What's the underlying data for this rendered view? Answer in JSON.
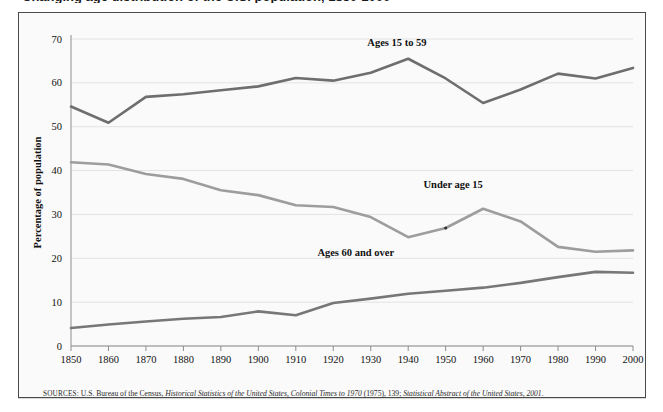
{
  "figure": {
    "title_partial": "Changing age distribution of the U.S. population, 1850-2000",
    "source_prefix": "SOURCES:",
    "source_parts": {
      "p1": " U.S. Bureau of the Census, ",
      "i1": "Historical Statistics of the United States, Colonial Times to 1970",
      "p2": " (1975), 139; ",
      "i2": "Statistical Abstract of the United States, 2001",
      "p3": "."
    }
  },
  "colors": {
    "ages_15_to_59": "#6e6e6e",
    "under_age_15": "#9d9d9d",
    "ages_60_and_over": "#777777",
    "gridline": "#e2e2e2",
    "axis": "#8d8d8d",
    "frame": "#4a4a4a",
    "plot_background": "#fafafa"
  },
  "chart_data": {
    "type": "line",
    "title": "Changing age distribution of the U.S. population, 1850-2000",
    "xlabel": "",
    "ylabel": "Percentage of population",
    "xlim": [
      1850,
      2000
    ],
    "ylim": [
      0,
      70
    ],
    "grid": true,
    "legend": "inline-labels",
    "x": [
      1850,
      1860,
      1870,
      1880,
      1890,
      1900,
      1910,
      1920,
      1930,
      1940,
      1950,
      1960,
      1970,
      1980,
      1990,
      2000
    ],
    "xtick_labels": [
      "1850",
      "1860",
      "1870",
      "1880",
      "1890",
      "1900",
      "1910",
      "1920",
      "1930",
      "1940",
      "1950",
      "1960",
      "1970",
      "1980",
      "1990",
      "2000"
    ],
    "ytick_labels": [
      "0",
      "10",
      "20",
      "30",
      "40",
      "50",
      "60",
      "70"
    ],
    "yticks": [
      0,
      10,
      20,
      30,
      40,
      50,
      60,
      70
    ],
    "series": [
      {
        "name": "Ages 15 to 59",
        "label": "Ages 15 to 59",
        "color": "#6e6e6e",
        "values": [
          54.6,
          50.9,
          56.8,
          57.4,
          58.3,
          59.2,
          61.1,
          60.5,
          62.3,
          65.5,
          61.0,
          55.4,
          58.5,
          62.1,
          61.0,
          63.4
        ]
      },
      {
        "name": "Under age 15",
        "label": "Under age 15",
        "color": "#9d9d9d",
        "values": [
          41.9,
          41.4,
          39.2,
          38.1,
          35.5,
          34.4,
          32.1,
          31.7,
          29.4,
          24.8,
          26.9,
          31.3,
          28.4,
          22.6,
          21.5,
          21.8
        ]
      },
      {
        "name": "Ages 60 and over",
        "label": "Ages 60 and over",
        "color": "#777777",
        "values": [
          4.1,
          4.9,
          5.6,
          6.2,
          6.6,
          7.9,
          7.0,
          9.8,
          10.8,
          11.9,
          12.6,
          13.3,
          14.4,
          15.7,
          16.9,
          16.7
        ]
      }
    ],
    "annotations": [
      {
        "name": "label-ages-15-to-59",
        "text": "Ages 15 to 59",
        "x": 1937,
        "y": 68.5
      },
      {
        "name": "label-under-age-15",
        "text": "Under age 15",
        "x": 1952,
        "y": 36.0
      },
      {
        "name": "label-ages-60-and-over",
        "text": "Ages 60 and over",
        "x": 1926,
        "y": 20.6
      }
    ]
  }
}
